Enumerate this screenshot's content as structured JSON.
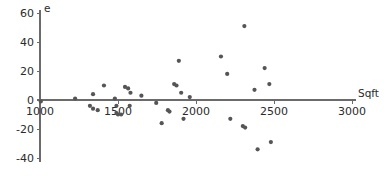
{
  "chart_data": {
    "type": "scatter",
    "title": "",
    "subtitle": "",
    "xlabel": "Sqft",
    "ylabel": "e",
    "xlim": [
      1000,
      3000
    ],
    "ylim": [
      -40,
      60
    ],
    "xticks": [
      1000,
      1500,
      2000,
      2500,
      3000
    ],
    "yticks": [
      -40,
      -20,
      0,
      20,
      40,
      60
    ],
    "xtick_labels": [
      "1000",
      "1500",
      "2000",
      "2500",
      "3000"
    ],
    "ytick_labels": [
      "-40",
      "-20",
      "0",
      "20",
      "40",
      "60"
    ],
    "grid": false,
    "legend": null,
    "point_color": "#555555",
    "axis_color": "#6b6b6b",
    "zero_line": true,
    "series": [
      {
        "name": "residuals",
        "points": [
          [
            1005,
            -1
          ],
          [
            1225,
            1
          ],
          [
            1320,
            -4
          ],
          [
            1340,
            -6
          ],
          [
            1370,
            -7
          ],
          [
            1340,
            4
          ],
          [
            1410,
            10
          ],
          [
            1480,
            1
          ],
          [
            1490,
            -4
          ],
          [
            1490,
            -9
          ],
          [
            1500,
            -10
          ],
          [
            1520,
            -10
          ],
          [
            1545,
            9
          ],
          [
            1565,
            8
          ],
          [
            1580,
            5
          ],
          [
            1575,
            -4
          ],
          [
            1650,
            3
          ],
          [
            1745,
            -2
          ],
          [
            1780,
            -16
          ],
          [
            1820,
            -7
          ],
          [
            1830,
            -8
          ],
          [
            1860,
            11
          ],
          [
            1875,
            10
          ],
          [
            1890,
            27
          ],
          [
            1905,
            5
          ],
          [
            1920,
            -13
          ],
          [
            1960,
            2
          ],
          [
            2160,
            30
          ],
          [
            2200,
            18
          ],
          [
            2220,
            -13
          ],
          [
            2300,
            -18
          ],
          [
            2315,
            -19
          ],
          [
            2310,
            51
          ],
          [
            2375,
            7
          ],
          [
            2395,
            -34
          ],
          [
            2440,
            22
          ],
          [
            2470,
            11
          ],
          [
            2480,
            -29
          ]
        ]
      }
    ]
  },
  "axis_labels": {
    "y_axis_title": "e",
    "x_axis_title": "Sqft"
  }
}
